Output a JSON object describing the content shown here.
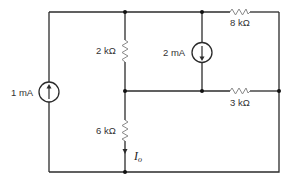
{
  "diagram": {
    "type": "electrical-circuit",
    "sources": [
      {
        "id": "source_1mA",
        "label": "1 mA",
        "kind": "current-source",
        "direction": "up"
      },
      {
        "id": "source_2mA",
        "label": "2 mA",
        "kind": "current-source",
        "direction": "down"
      }
    ],
    "resistors": [
      {
        "id": "r_2k",
        "label": "2 kΩ"
      },
      {
        "id": "r_6k",
        "label": "6 kΩ"
      },
      {
        "id": "r_8k",
        "label": "8 kΩ"
      },
      {
        "id": "r_3k",
        "label": "3 kΩ"
      }
    ],
    "current_label": {
      "symbol": "I",
      "subscript": "o",
      "direction": "down"
    },
    "colors": {
      "wire": "#2b2b2b",
      "resistor": "#8a8a8a",
      "text": "#333333"
    }
  }
}
